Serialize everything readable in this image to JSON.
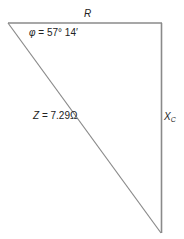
{
  "diagram": {
    "line_color": "#8a8a8a",
    "vertices": {
      "top_left": [
        8,
        23
      ],
      "top_right": [
        162,
        23
      ],
      "bottom": [
        161,
        233
      ]
    },
    "labels": {
      "r": "R",
      "phi_symbol": "φ",
      "phi_rest": " = 57° 14′",
      "z_symbol": "Z",
      "z_rest": " = 7.29Ω",
      "xc_main": "X",
      "xc_sub": "C"
    },
    "values": {
      "phase_angle": "57° 14′",
      "impedance": "7.29Ω"
    }
  }
}
